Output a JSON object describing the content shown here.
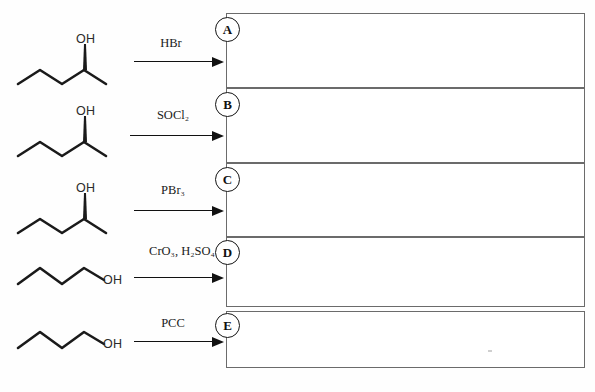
{
  "document": {
    "kind": "organic-chemistry-worksheet",
    "instruction_text": "",
    "background_color": "#fefefe",
    "ink_color": "#1a1a1a",
    "box_border_color": "#6b6b6b"
  },
  "reactions": [
    {
      "id": "row-a",
      "substrate_name": "2-pentanol",
      "substrate_oh_label": "OH",
      "substrate_stereo": "wedge",
      "reagent": "HBr",
      "reagent_plain": "HBr",
      "answer_letter": "A"
    },
    {
      "id": "row-b",
      "substrate_name": "2-pentanol",
      "substrate_oh_label": "OH",
      "substrate_stereo": "wedge",
      "reagent": "SOCl2",
      "reagent_plain": "SOCl₂",
      "answer_letter": "B"
    },
    {
      "id": "row-c",
      "substrate_name": "2-pentanol",
      "substrate_oh_label": "OH",
      "substrate_stereo": "wedge",
      "reagent": "PBr3",
      "reagent_plain": "PBr₃",
      "answer_letter": "C"
    },
    {
      "id": "row-d",
      "substrate_name": "1-butanol",
      "substrate_oh_label": "OH",
      "substrate_stereo": "none",
      "reagent": "CrO3, H2SO4",
      "reagent_plain": "CrO₃, H₂SO₄",
      "answer_letter": "D"
    },
    {
      "id": "row-e",
      "substrate_name": "1-butanol",
      "substrate_oh_label": "OH",
      "substrate_stereo": "none",
      "reagent": "PCC",
      "reagent_plain": "PCC",
      "answer_letter": "E"
    }
  ],
  "answer_boxes": [
    {
      "letter": "A",
      "content": ""
    },
    {
      "letter": "B",
      "content": ""
    },
    {
      "letter": "C",
      "content": ""
    },
    {
      "letter": "D",
      "content": ""
    },
    {
      "letter": "E",
      "content": ""
    }
  ]
}
